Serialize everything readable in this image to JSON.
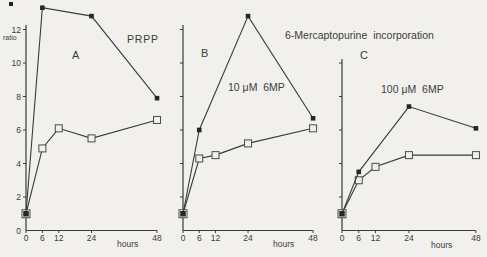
{
  "figure": {
    "title": "6-Mercaptopurine  incorporation",
    "y_axis_label": "ratio",
    "background": "#f1f0ec",
    "ink": "#3a3a3a",
    "marker_fill": "#262626",
    "panels": [
      {
        "letter": "A",
        "series_label": "PRPP",
        "x_axis_label": "hours"
      },
      {
        "letter": "B",
        "series_label": "10 μM  6MP",
        "x_axis_label": "hours"
      },
      {
        "letter": "C",
        "series_label": "100 μM  6MP",
        "x_axis_label": "hours"
      }
    ]
  },
  "chart_data": [
    {
      "type": "line",
      "panel": "A",
      "annotation": "PRPP",
      "xlabel": "hours",
      "ylabel": "ratio",
      "xlim": [
        0,
        48
      ],
      "ylim": [
        0,
        13.5
      ],
      "x_ticks": [
        0,
        6,
        12,
        24,
        48
      ],
      "y_ticks": [
        0,
        2,
        4,
        6,
        8,
        10,
        12
      ],
      "show_y_tick_labels": true,
      "legend": "none",
      "series": [
        {
          "name": "filled-square",
          "marker": "filled-square",
          "x": [
            0,
            6,
            24,
            48
          ],
          "y": [
            1.0,
            13.3,
            12.8,
            7.9
          ]
        },
        {
          "name": "open-square",
          "marker": "open-square",
          "x": [
            0,
            6,
            12,
            24,
            48
          ],
          "y": [
            1.0,
            4.9,
            6.1,
            5.5,
            6.6
          ]
        }
      ]
    },
    {
      "type": "line",
      "panel": "B",
      "annotation": "10 μM  6MP",
      "xlabel": "hours",
      "ylabel": "",
      "xlim": [
        0,
        48
      ],
      "ylim": [
        0,
        13.5
      ],
      "x_ticks": [
        0,
        6,
        12,
        24,
        48
      ],
      "y_ticks": [
        2,
        4,
        6,
        8,
        10,
        12
      ],
      "show_y_tick_labels": false,
      "legend": "none",
      "series": [
        {
          "name": "filled-square",
          "marker": "filled-square",
          "x": [
            0,
            6,
            24,
            48
          ],
          "y": [
            1.0,
            6.0,
            12.8,
            6.7
          ]
        },
        {
          "name": "open-square",
          "marker": "open-square",
          "x": [
            0,
            6,
            12,
            24,
            48
          ],
          "y": [
            1.0,
            4.3,
            4.5,
            5.2,
            6.1
          ]
        }
      ]
    },
    {
      "type": "line",
      "panel": "C",
      "annotation": "100 μM  6MP",
      "xlabel": "hours",
      "ylabel": "",
      "xlim": [
        0,
        48
      ],
      "ylim": [
        0,
        10.2
      ],
      "x_ticks": [
        0,
        6,
        12,
        24,
        48
      ],
      "y_ticks": [
        2,
        4,
        6,
        8,
        10
      ],
      "show_y_tick_labels": false,
      "legend": "none",
      "series": [
        {
          "name": "filled-square",
          "marker": "filled-square",
          "x": [
            0,
            6,
            24,
            48
          ],
          "y": [
            1.0,
            3.5,
            7.4,
            6.1
          ]
        },
        {
          "name": "open-square",
          "marker": "open-square",
          "x": [
            0,
            6,
            12,
            24,
            48
          ],
          "y": [
            1.0,
            3.0,
            3.8,
            4.5,
            4.5
          ]
        }
      ]
    }
  ]
}
